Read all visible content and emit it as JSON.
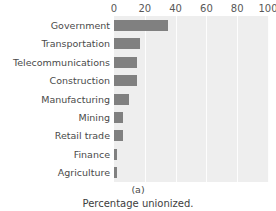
{
  "chart_data": {
    "type": "bar",
    "orientation": "horizontal",
    "title": "",
    "xlabel": "",
    "ylabel": "",
    "xlim": [
      0,
      100
    ],
    "xticks": [
      0,
      20,
      40,
      60,
      80,
      100
    ],
    "grid": true,
    "legend": null,
    "bar_color": "#808080",
    "plot_background": "#eeeeee",
    "gridline_color": "#fdfdfd",
    "categories": [
      "Government",
      "Transportation",
      "Telecommunications",
      "Construction",
      "Manufacturing",
      "Mining",
      "Retail trade",
      "Finance",
      "Agriculture"
    ],
    "values": [
      35,
      17,
      15,
      15,
      10,
      6,
      6,
      2,
      2
    ]
  },
  "caption": {
    "letter": "(a)",
    "text": "Percentage unionized."
  }
}
